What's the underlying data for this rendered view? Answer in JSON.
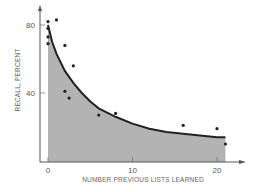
{
  "chart_data": {
    "type": "scatter",
    "title": "",
    "xlabel": "NUMBER PREVIOUS LISTS LEARNED",
    "ylabel": "RECALL, PERCENT",
    "xlim": [
      0,
      23
    ],
    "ylim": [
      0,
      85
    ],
    "xticks": [
      0,
      10,
      20
    ],
    "yticks": [
      40,
      80
    ],
    "grid": false,
    "legend": null,
    "series": [
      {
        "name": "observed",
        "type": "scatter",
        "points": [
          {
            "x": 0,
            "y": 82
          },
          {
            "x": 0,
            "y": 78
          },
          {
            "x": 0,
            "y": 73
          },
          {
            "x": 0,
            "y": 69
          },
          {
            "x": 1,
            "y": 83
          },
          {
            "x": 2,
            "y": 68
          },
          {
            "x": 3,
            "y": 56
          },
          {
            "x": 2,
            "y": 41
          },
          {
            "x": 2.5,
            "y": 37
          },
          {
            "x": 6,
            "y": 27
          },
          {
            "x": 8,
            "y": 28
          },
          {
            "x": 16,
            "y": 21
          },
          {
            "x": 20,
            "y": 19
          },
          {
            "x": 21,
            "y": 10
          }
        ]
      },
      {
        "name": "fitted curve",
        "type": "area",
        "x": [
          0,
          0.5,
          1,
          2,
          3,
          4,
          5,
          6,
          8,
          10,
          12,
          14,
          16,
          18,
          20,
          21
        ],
        "values": [
          80,
          70,
          63,
          53,
          46,
          40,
          35,
          31,
          26,
          22,
          19,
          17,
          16,
          15,
          14,
          14
        ]
      }
    ],
    "colors": {
      "area": "#b3b3b3",
      "curve": "#222222",
      "points": "#222222",
      "axis": "#555555"
    }
  }
}
